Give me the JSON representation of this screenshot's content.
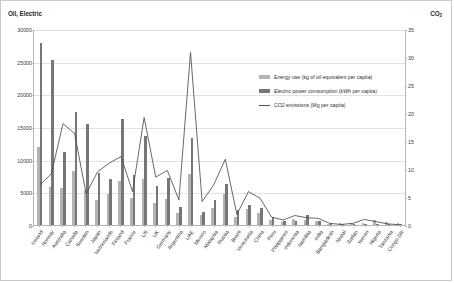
{
  "chart_data": {
    "type": "bar",
    "title": "",
    "left_axis_title": "Oil, Electric",
    "right_axis_title": "CO2",
    "right_axis_title_base": "CO",
    "right_axis_title_sub": "2",
    "xlabel": "",
    "ylabel": "",
    "ylim": [
      0,
      30000
    ],
    "y2lim": [
      0,
      35
    ],
    "ytick_labels": [
      "0",
      "5000",
      "10000",
      "15000",
      "20000",
      "25000",
      "30000"
    ],
    "ytick_values": [
      0,
      5000,
      10000,
      15000,
      20000,
      25000,
      30000
    ],
    "y2tick_labels": [
      "0",
      "5",
      "10",
      "15",
      "20",
      "25",
      "30",
      "35"
    ],
    "y2tick_values": [
      0,
      5,
      10,
      15,
      20,
      25,
      30,
      35
    ],
    "grid": true,
    "legend_position": "inside-right",
    "categories": [
      "Iceland",
      "Norway",
      "Australia",
      "Canada",
      "Sweden",
      "Japan",
      "Netherlands",
      "Finland",
      "France",
      "US",
      "UK",
      "Germany",
      "Argentina",
      "UAE",
      "Mexico",
      "Malaysia",
      "Russia",
      "Brazil",
      "Venezuela",
      "China",
      "Peru",
      "Philippines",
      "Indonesia",
      "Namibia",
      "India",
      "Bangladesh",
      "Nepal",
      "Sudan",
      "Yemen",
      "Nigeria",
      "Tanzania",
      "Congo DR"
    ],
    "series": [
      {
        "name": "Energy use (kg of oil equivalent per capita)",
        "axis": "left",
        "color": "#b3b3b3",
        "values": [
          12000,
          5800,
          5700,
          8300,
          5400,
          3900,
          4800,
          6800,
          4100,
          7000,
          3300,
          4000,
          1900,
          7800,
          1600,
          2600,
          4800,
          1300,
          2400,
          1800,
          700,
          450,
          860,
          740,
          570,
          210,
          340,
          350,
          320,
          720,
          450,
          380
        ]
      },
      {
        "name": "Electric power consumption (kWh per capita)",
        "axis": "left",
        "color": "#767676",
        "values": [
          27900,
          25200,
          11100,
          17300,
          15400,
          8000,
          7100,
          16200,
          7700,
          13700,
          6000,
          7200,
          2700,
          13300,
          2000,
          3900,
          6300,
          2300,
          3100,
          2600,
          1200,
          650,
          650,
          1600,
          640,
          250,
          100,
          110,
          190,
          130,
          90,
          100
        ]
      }
    ],
    "line_series": {
      "name": "CO2 emissions (Mg per capita)",
      "axis": "right",
      "color": "#4d4d4d",
      "values": [
        7.2,
        9.2,
        18.2,
        16.4,
        5.6,
        9.6,
        11.1,
        12.3,
        6.0,
        19.3,
        8.6,
        9.8,
        4.5,
        31.0,
        4.2,
        7.2,
        11.8,
        1.9,
        6.0,
        4.8,
        1.4,
        0.9,
        1.7,
        1.3,
        1.2,
        0.3,
        0.1,
        0.3,
        1.0,
        0.6,
        0.2,
        0.05
      ]
    },
    "legend": [
      {
        "label": "Energy use (kg of oil equivalent per capita)",
        "icon": "bar-swatch-light",
        "color": "#b3b3b3"
      },
      {
        "label": "Electric power consumption (kWh per capita)",
        "icon": "bar-swatch-dark",
        "color": "#767676"
      },
      {
        "label": "CO2 emissions (Mg per capita)",
        "icon": "line-swatch",
        "color": "#4d4d4d"
      }
    ]
  }
}
